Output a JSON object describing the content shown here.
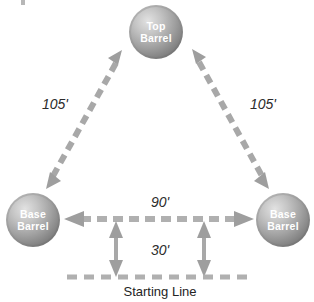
{
  "diagram": {
    "background_color": "#ffffff",
    "barrel_fill_light": "#d8d8d8",
    "barrel_fill_mid": "#9a9a9a",
    "barrel_fill_dark": "#7c7c7c",
    "barrel_text_color": "#ffffff",
    "arrow_color": "#9e9e9e",
    "dash_color": "#b0b0b0",
    "label_color": "#2b2b2b",
    "barrels": [
      {
        "id": "top-barrel",
        "line1": "Top",
        "line2": "Barrel",
        "cx": 156,
        "cy": 32,
        "r": 27
      },
      {
        "id": "left-base-barrel",
        "line1": "Base",
        "line2": "Barrel",
        "cx": 33,
        "cy": 220,
        "r": 27
      },
      {
        "id": "right-base-barrel",
        "line1": "Base",
        "line2": "Barrel",
        "cx": 283,
        "cy": 220,
        "r": 27
      }
    ],
    "measurements": [
      {
        "id": "left-diagonal",
        "label": "105'",
        "label_x": 55,
        "label_y": 109
      },
      {
        "id": "right-diagonal",
        "label": "105'",
        "label_x": 263,
        "label_y": 109
      },
      {
        "id": "base-to-base",
        "label": "90'",
        "label_x": 160,
        "label_y": 207
      },
      {
        "id": "start-to-base",
        "label": "30'",
        "label_x": 160,
        "label_y": 255
      }
    ],
    "starting_line": {
      "id": "starting-line",
      "label": "Starting Line",
      "label_x": 160,
      "label_y": 296,
      "y": 277,
      "x1": 67,
      "x2": 252
    }
  }
}
